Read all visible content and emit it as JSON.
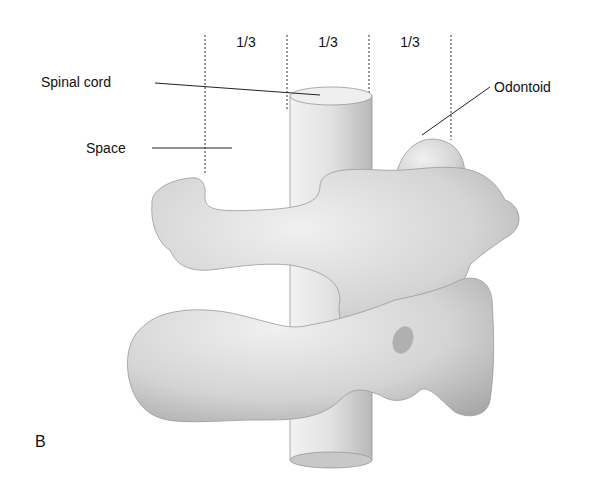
{
  "figure": {
    "panel_letter": "B",
    "thirds": [
      "1/3",
      "1/3",
      "1/3"
    ],
    "labels": {
      "spinal_cord": "Spinal cord",
      "space": "Space",
      "odontoid": "Odontoid"
    },
    "colors": {
      "bone": "#d9d9d9",
      "bone_shadow": "#a9a9a9",
      "cord": "#dcdcdc",
      "line": "#222222"
    }
  }
}
